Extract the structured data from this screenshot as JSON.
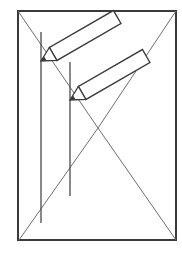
{
  "diagram": {
    "title": "",
    "colors": {
      "background": "#ffffff",
      "frame": "#3a3a3a",
      "diagonal": "#6e6e6e",
      "vertical": "#4a4a4a",
      "pencil": "#3a3a3a"
    },
    "frame": {
      "x": 18,
      "y": 11,
      "width": 158,
      "height": 229
    },
    "diagonals": [
      {
        "name": "diagonal-top-left-to-bottom-right-via-apex",
        "points": "18,11 98,128 176,11"
      },
      {
        "name": "triangle-lower",
        "points": "19,240 98,128 176,240"
      }
    ],
    "verticals": [
      {
        "x": 41,
        "y1": 32,
        "y2": 223
      },
      {
        "x": 70,
        "y1": 62,
        "y2": 196
      }
    ],
    "pencils": [
      {
        "tip": [
          41,
          61
        ],
        "angle": -30,
        "length": 88,
        "width": 15
      },
      {
        "tip": [
          70,
          100
        ],
        "angle": -30,
        "length": 88,
        "width": 15
      }
    ]
  }
}
